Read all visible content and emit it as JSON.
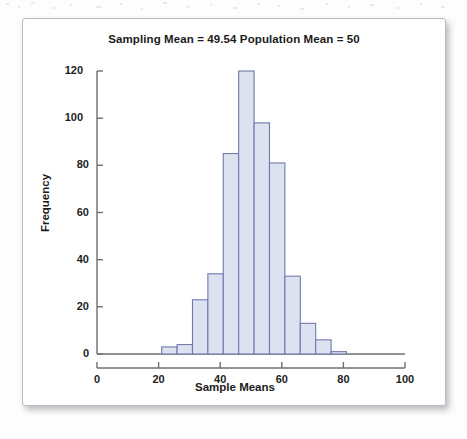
{
  "figure": {
    "title": "Sampling Mean = 49.54 Population Mean = 50"
  },
  "chart_data": {
    "type": "bar",
    "title": "Sampling Mean = 49.54 Population Mean = 50",
    "xlabel": "Sample Means",
    "ylabel": "Frequency",
    "xlim": [
      0,
      100
    ],
    "ylim": [
      0,
      120
    ],
    "xticks": [
      "0",
      "20",
      "40",
      "60",
      "80",
      "100"
    ],
    "xtick_values": [
      0,
      20,
      40,
      60,
      80,
      100
    ],
    "yticks": [
      "0",
      "20",
      "40",
      "60",
      "80",
      "100",
      "120"
    ],
    "ytick_values": [
      0,
      20,
      40,
      60,
      80,
      100,
      120
    ],
    "grid": false,
    "legend": null,
    "bin_width": 5,
    "bars": [
      {
        "bin_start": 21,
        "bin_end": 26,
        "center": 23.5,
        "value": 3
      },
      {
        "bin_start": 26,
        "bin_end": 31,
        "center": 28.5,
        "value": 4
      },
      {
        "bin_start": 31,
        "bin_end": 36,
        "center": 33.5,
        "value": 23
      },
      {
        "bin_start": 36,
        "bin_end": 41,
        "center": 38.5,
        "value": 34
      },
      {
        "bin_start": 41,
        "bin_end": 46,
        "center": 43.5,
        "value": 85
      },
      {
        "bin_start": 46,
        "bin_end": 51,
        "center": 48.5,
        "value": 120
      },
      {
        "bin_start": 51,
        "bin_end": 56,
        "center": 53.5,
        "value": 98
      },
      {
        "bin_start": 56,
        "bin_end": 61,
        "center": 58.5,
        "value": 81
      },
      {
        "bin_start": 61,
        "bin_end": 66,
        "center": 63.5,
        "value": 33
      },
      {
        "bin_start": 66,
        "bin_end": 71,
        "center": 68.5,
        "value": 13
      },
      {
        "bin_start": 71,
        "bin_end": 76,
        "center": 73.5,
        "value": 6
      },
      {
        "bin_start": 76,
        "bin_end": 81,
        "center": 78.5,
        "value": 1
      }
    ],
    "categories": [
      23.5,
      28.5,
      33.5,
      38.5,
      43.5,
      48.5,
      53.5,
      58.5,
      63.5,
      68.5,
      73.5,
      78.5
    ],
    "values": [
      3,
      4,
      23,
      34,
      85,
      120,
      98,
      81,
      33,
      13,
      6,
      1
    ],
    "colors": {
      "bar_fill": "#dde2f1",
      "bar_edge": "#7079ad",
      "axis": "#6f6f6f",
      "text": "#1b1b1b",
      "frame_border": "#b9bcc4",
      "plot_background": "#ffffff"
    }
  }
}
